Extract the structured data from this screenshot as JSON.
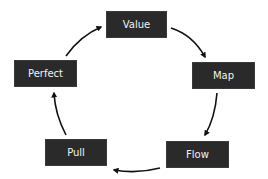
{
  "diagram": {
    "type": "cycle",
    "colors": {
      "background": "#ffffff",
      "node_fill": "#2a2a2a",
      "node_text": "#f2f2f2",
      "arrow": "#111111"
    },
    "nodes": [
      {
        "id": "value",
        "label": "Value"
      },
      {
        "id": "map",
        "label": "Map"
      },
      {
        "id": "flow",
        "label": "Flow"
      },
      {
        "id": "pull",
        "label": "Pull"
      },
      {
        "id": "perfect",
        "label": "Perfect"
      }
    ],
    "edges": [
      {
        "from": "Value",
        "to": "Map"
      },
      {
        "from": "Map",
        "to": "Flow"
      },
      {
        "from": "Flow",
        "to": "Pull"
      },
      {
        "from": "Pull",
        "to": "Perfect"
      },
      {
        "from": "Perfect",
        "to": "Value"
      }
    ]
  }
}
